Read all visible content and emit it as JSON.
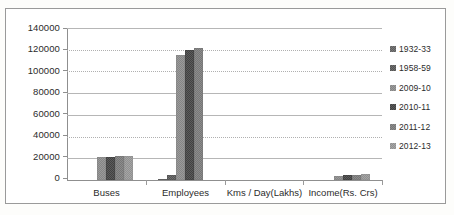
{
  "chart_data": {
    "type": "bar",
    "title": "",
    "subtitle": "",
    "xlabel": "",
    "ylabel": "",
    "ylim": [
      0,
      140000
    ],
    "yticks": [
      "0",
      "20000",
      "40000",
      "60000",
      "80000",
      "100000",
      "120000",
      "140000"
    ],
    "grid": true,
    "legend_position": "right",
    "categories": [
      "Buses",
      "Employees",
      "Kms / Day(Lakhs)",
      "Income(Rs. Crs)"
    ],
    "series": [
      {
        "name": "1932-33",
        "values": [
          0,
          1300,
          0,
          0
        ]
      },
      {
        "name": "1958-59",
        "values": [
          0,
          4200,
          0,
          0
        ]
      },
      {
        "name": "2009-10",
        "values": [
          21000,
          115000,
          55,
          3900
        ]
      },
      {
        "name": "2010-11",
        "values": [
          21600,
          120000,
          57,
          4500
        ]
      },
      {
        "name": "2011-12",
        "values": [
          22000,
          122000,
          58,
          5000
        ]
      },
      {
        "name": "2012-13",
        "values": [
          22000,
          0,
          58,
          5100
        ]
      }
    ]
  },
  "legend": {
    "items": [
      {
        "label": "1932-33"
      },
      {
        "label": "1958-59"
      },
      {
        "label": "2009-10"
      },
      {
        "label": "2010-11"
      },
      {
        "label": "2011-12"
      },
      {
        "label": "2012-13"
      }
    ]
  },
  "axes": {
    "y": {
      "ticks": [
        "140000",
        "120000",
        "100000",
        "80000",
        "60000",
        "40000",
        "20000",
        "0"
      ]
    },
    "x": {
      "ticks": [
        "Buses",
        "Employees",
        "Kms / Day(Lakhs)",
        "Income(Rs. Crs)"
      ]
    }
  }
}
